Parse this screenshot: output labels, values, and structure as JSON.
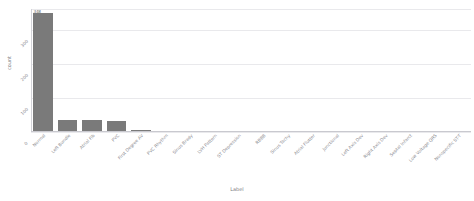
{
  "chart_data": {
    "type": "bar",
    "title": "",
    "xlabel": "Label",
    "ylabel": "count",
    "grid": true,
    "grid_axis": "y",
    "legend": false,
    "bar_color": "#7a7a7a",
    "tick_rotation": -45,
    "ylim": [
      0,
      360
    ],
    "yticks": [
      0,
      100,
      200,
      300
    ],
    "ytick_labels": [
      "0",
      "100",
      "200",
      "300"
    ],
    "annotations": [
      {
        "text": "348",
        "category": "Normal",
        "value": 348
      }
    ],
    "categories": [
      "Normal",
      "Left Bundle",
      "Atrial Fib",
      "PVC",
      "First Degree AV",
      "PVC Rhythm",
      "Sinus Brady",
      "LVH Pattern",
      "ST Depression",
      "RBBB",
      "Sinus Tachy",
      "Atrial Flutter",
      "Junctional",
      "Left Axis Dev",
      "Right Axis Dev",
      "Septal Infarct",
      "Low Voltage QRS",
      "Nonspecific ST-T"
    ],
    "values": [
      348,
      36,
      34,
      33,
      5,
      4,
      4,
      3,
      3,
      3,
      2,
      2,
      2,
      2,
      1,
      1,
      1,
      1
    ]
  },
  "figure": {
    "background": "#ffffff",
    "axes_color": "#c9c9cf",
    "grid_color": "#e9e9ec",
    "text_color": "#8a8a90"
  }
}
